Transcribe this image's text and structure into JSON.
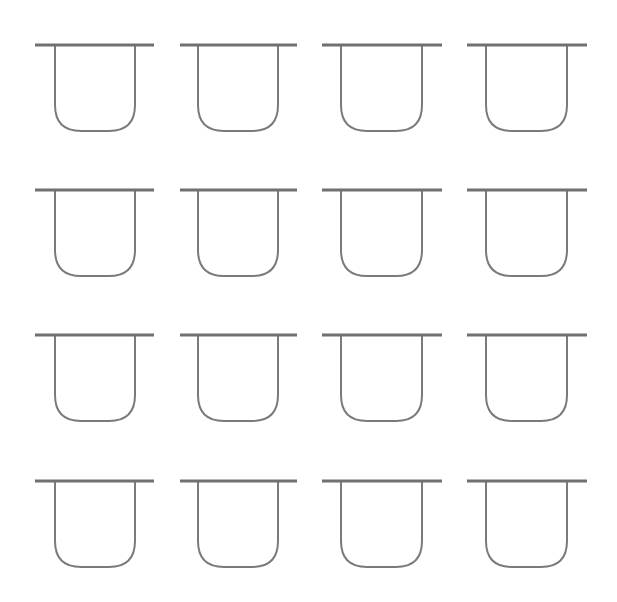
{
  "canvas": {
    "width": 617,
    "height": 602,
    "background": "#ffffff"
  },
  "style": {
    "bar_color": "#707070",
    "bar_width": 3,
    "cup_color": "#7a7a7a",
    "cup_width": 2,
    "corner_radius": 26
  },
  "grid": {
    "rows": 4,
    "cols": 4,
    "row_tops": [
      45,
      190,
      335,
      481
    ],
    "col_bars": [
      [
        35,
        154
      ],
      [
        180,
        297
      ],
      [
        322,
        442
      ],
      [
        467,
        587
      ]
    ],
    "col_sides": [
      [
        55,
        135
      ],
      [
        198,
        278
      ],
      [
        341,
        422
      ],
      [
        486,
        567
      ]
    ],
    "cup_depth": 86
  },
  "shapes": [
    {
      "row": 0,
      "col": 0
    },
    {
      "row": 0,
      "col": 1
    },
    {
      "row": 0,
      "col": 2
    },
    {
      "row": 0,
      "col": 3
    },
    {
      "row": 1,
      "col": 0
    },
    {
      "row": 1,
      "col": 1
    },
    {
      "row": 1,
      "col": 2
    },
    {
      "row": 1,
      "col": 3
    },
    {
      "row": 2,
      "col": 0
    },
    {
      "row": 2,
      "col": 1
    },
    {
      "row": 2,
      "col": 2
    },
    {
      "row": 2,
      "col": 3
    },
    {
      "row": 3,
      "col": 0
    },
    {
      "row": 3,
      "col": 1
    },
    {
      "row": 3,
      "col": 2
    },
    {
      "row": 3,
      "col": 3
    }
  ]
}
